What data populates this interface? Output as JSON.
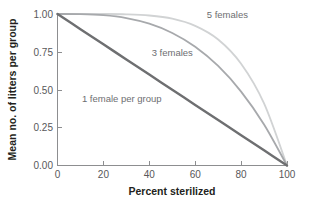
{
  "chart_data": {
    "type": "line",
    "title": "",
    "xlabel": "Percent sterilized",
    "ylabel": "Mean no. of litters per group",
    "xlim": [
      0,
      100
    ],
    "ylim": [
      0.0,
      1.0
    ],
    "xticks": [
      "0",
      "20",
      "40",
      "60",
      "80",
      "100"
    ],
    "xtick_values": [
      0,
      20,
      40,
      60,
      80,
      100
    ],
    "yticks": [
      "0.00",
      "0.25",
      "0.50",
      "0.75",
      "1.00"
    ],
    "ytick_values": [
      0.0,
      0.25,
      0.5,
      0.75,
      1.0
    ],
    "grid": false,
    "legend_position": "inline-annotations",
    "x": [
      0,
      10,
      20,
      30,
      40,
      50,
      60,
      70,
      80,
      90,
      100
    ],
    "series": [
      {
        "name": "1 female per group",
        "label": "1 female per group",
        "color": "#6e6f71",
        "label_x": 28,
        "label_y": 0.42,
        "values": [
          1.0,
          0.9,
          0.8,
          0.7,
          0.6,
          0.5,
          0.4,
          0.3,
          0.2,
          0.1,
          0.0
        ]
      },
      {
        "name": "3 females",
        "label": "3 females",
        "color": "#a7a9ac",
        "label_x": 50,
        "label_y": 0.72,
        "values": [
          1.0,
          0.999,
          0.992,
          0.973,
          0.936,
          0.875,
          0.784,
          0.657,
          0.488,
          0.271,
          0.0
        ]
      },
      {
        "name": "5 females",
        "label": "5 females",
        "color": "#d1d3d4",
        "label_x": 74,
        "label_y": 0.975,
        "values": [
          1.0,
          1.0,
          1.0,
          0.998,
          0.99,
          0.969,
          0.922,
          0.832,
          0.672,
          0.41,
          0.0
        ]
      }
    ],
    "colors": {
      "axis": "#8d8e90",
      "tick_text": "#58585a",
      "axis_title": "#231f20",
      "background": "#ffffff",
      "series_1_female": "#6e6f71",
      "series_3_females": "#a7a9ac",
      "series_5_females": "#d1d3d4"
    }
  }
}
